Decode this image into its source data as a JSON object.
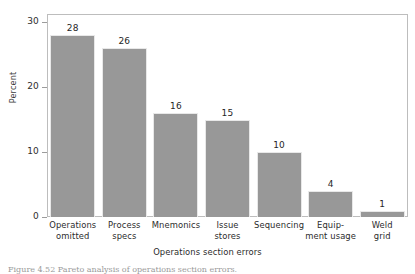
{
  "chart_data": {
    "type": "bar",
    "title": "",
    "xlabel": "Operations section errors",
    "ylabel": "Percent",
    "categories": [
      "Operations omitted",
      "Process specs",
      "Mnemonics",
      "Issue stores",
      "Sequencing",
      "Equip- ment usage",
      "Weld grid"
    ],
    "category_lines": [
      [
        "Operations",
        "omitted"
      ],
      [
        "Process",
        "specs"
      ],
      [
        "Mnemonics",
        ""
      ],
      [
        "Issue",
        "stores"
      ],
      [
        "Sequencing",
        ""
      ],
      [
        "Equip-",
        "ment usage"
      ],
      [
        "Weld",
        "grid"
      ]
    ],
    "values": [
      28,
      26,
      16,
      15,
      10,
      4,
      1
    ],
    "value_labels": [
      "28",
      "26",
      "16",
      "15",
      "10",
      "4",
      "1"
    ],
    "ylim": [
      0,
      30
    ],
    "yticks": [
      0,
      10,
      20,
      30
    ],
    "ytick_labels": [
      "0",
      "10",
      "20",
      "30"
    ],
    "grid": false,
    "legend": null,
    "bar_color": "#989898",
    "frame_color": "#bdbdbd",
    "text_color": "#2b2b2b"
  },
  "caption": {
    "text": "Figure 4.52  Pareto analysis of operations section errors."
  }
}
